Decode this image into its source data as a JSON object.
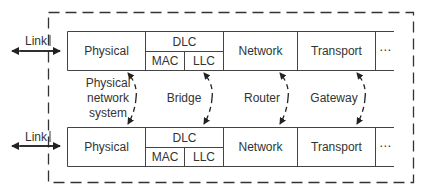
{
  "diagram": {
    "outer_boundary": "dashed",
    "colors": {
      "line": "#333333",
      "background": "#ffffff",
      "text": "#333333"
    },
    "stacks": [
      {
        "id": "top",
        "link_label": "Link",
        "layers": {
          "physical": "Physical",
          "dlc": "DLC",
          "mac": "MAC",
          "llc": "LLC",
          "network": "Network",
          "transport": "Transport",
          "more": "⋯"
        }
      },
      {
        "id": "bottom",
        "link_label": "Link",
        "layers": {
          "physical": "Physical",
          "dlc": "DLC",
          "mac": "MAC",
          "llc": "LLC",
          "network": "Network",
          "transport": "Transport",
          "more": "⋯"
        }
      }
    ],
    "interconnects": [
      {
        "layer": "Physical",
        "device_line1": "Physical",
        "device_line2": "network",
        "device_line3": "system"
      },
      {
        "layer": "LLC",
        "device": "Bridge"
      },
      {
        "layer": "Network",
        "device": "Router"
      },
      {
        "layer": "Transport",
        "device": "Gateway"
      }
    ]
  }
}
